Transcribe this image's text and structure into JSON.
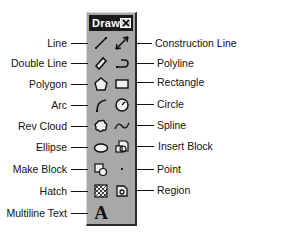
{
  "toolbar": {
    "title": "Draw",
    "close_icon": "close-icon",
    "colors": {
      "body": "#a8a8a8",
      "titlebar": "#1a1a1a",
      "title_text": "#ffffff"
    }
  },
  "rows": [
    {
      "left": {
        "label": "Line",
        "icon": "line-icon"
      },
      "right": {
        "label": "Construction Line",
        "icon": "construction-line-icon"
      }
    },
    {
      "left": {
        "label": "Double Line",
        "icon": "double-line-icon"
      },
      "right": {
        "label": "Polyline",
        "icon": "polyline-icon"
      }
    },
    {
      "left": {
        "label": "Polygon",
        "icon": "polygon-icon"
      },
      "right": {
        "label": "Rectangle",
        "icon": "rectangle-icon"
      }
    },
    {
      "left": {
        "label": "Arc",
        "icon": "arc-icon"
      },
      "right": {
        "label": "Circle",
        "icon": "circle-icon"
      }
    },
    {
      "left": {
        "label": "Rev Cloud",
        "icon": "rev-cloud-icon"
      },
      "right": {
        "label": "Spline",
        "icon": "spline-icon"
      }
    },
    {
      "left": {
        "label": "Ellipse",
        "icon": "ellipse-icon"
      },
      "right": {
        "label": "Insert Block",
        "icon": "insert-block-icon"
      }
    },
    {
      "left": {
        "label": "Make Block",
        "icon": "make-block-icon"
      },
      "right": {
        "label": "Point",
        "icon": "point-icon"
      }
    },
    {
      "left": {
        "label": "Hatch",
        "icon": "hatch-icon"
      },
      "right": {
        "label": "Region",
        "icon": "region-icon"
      }
    },
    {
      "left": {
        "label": "Multiline Text",
        "icon": "multiline-text-icon",
        "glyph": "A"
      }
    }
  ]
}
